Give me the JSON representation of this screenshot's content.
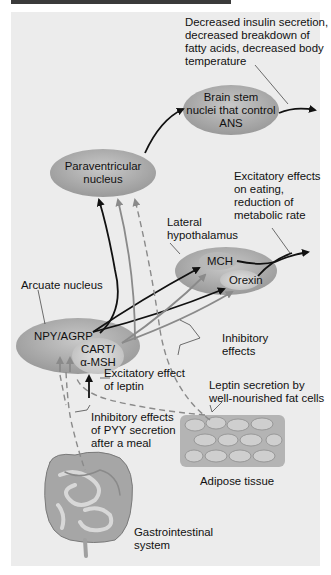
{
  "nodes": {
    "brainstem": {
      "line1": "Brain stem",
      "line2": "nuclei that control",
      "line3": "ANS"
    },
    "paraventricular": {
      "line1": "Paraventricular",
      "line2": "nucleus"
    },
    "lateral_hypothalamus": {
      "label_line1": "Lateral",
      "label_line2": "hypothalamus",
      "mch": "MCH",
      "orexin": "Orexin"
    },
    "arcuate": {
      "label": "Arcuate nucleus",
      "npy": "NPY/AGRP",
      "cart_line1": "CART/",
      "cart_line2": "α-MSH"
    }
  },
  "annotations": {
    "brainstem_effects": [
      "Decreased insulin secretion,",
      "decreased breakdown of",
      "fatty acids, decreased body",
      "temperature"
    ],
    "lh_effects": [
      "Excitatory effects",
      "on eating,",
      "reduction of",
      "metabolic rate"
    ],
    "inhibitory": [
      "Inhibitory",
      "effects"
    ],
    "excitatory_leptin": [
      "Excitatory effect",
      "of leptin"
    ],
    "leptin_secretion": [
      "Leptin secretion by",
      "well-nourished fat cells"
    ],
    "pyy": [
      "Inhibitory effects",
      "of PYY secretion",
      "after a meal"
    ],
    "adipose": "Adipose tissue",
    "gi": [
      "Gastrointestinal",
      "system"
    ]
  },
  "colors": {
    "panel": "#ececec",
    "node": "#a9a9a9",
    "inner_node": "#d0d0d0",
    "excitatory_arrow": "#111111",
    "inhibitory_arrow": "#8a8a8a"
  }
}
